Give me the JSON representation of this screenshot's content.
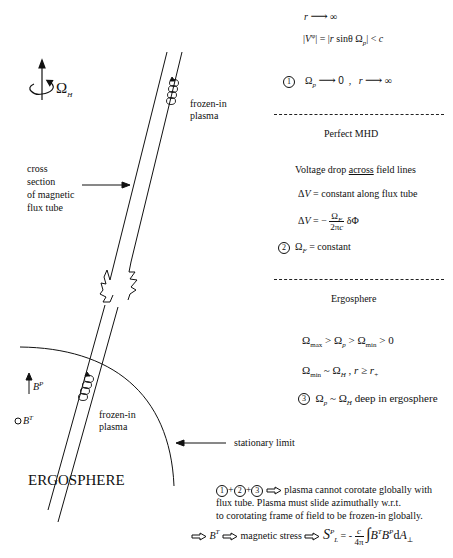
{
  "left_labels": {
    "omega_h": "Ω",
    "omega_h_sub": "H",
    "cross_section": [
      "cross",
      "section",
      "of magnetic",
      "flux tube"
    ],
    "frozen_in_top": [
      "frozen-in",
      "plasma"
    ],
    "frozen_in_bottom": [
      "frozen-in",
      "plasma"
    ],
    "b_poloidal": "B",
    "b_poloidal_sup": "P",
    "b_toroidal": "B",
    "b_toroidal_sup": "T",
    "stationary_limit": "stationary limit",
    "ergosphere_title": "ERGOSPHERE"
  },
  "right_panel": {
    "line1": {
      "r": "r",
      "arrow": "→",
      "inf": "∞"
    },
    "line2": {
      "text_left": "|V",
      "sup": "φ",
      "text_mid": "| = |",
      "r_sin": "r sinθ  Ω",
      "sub": "p",
      "text_right": "| < c"
    },
    "cond1": {
      "num": "1",
      "omega": "Ω",
      "sub": "p",
      "arrow_to": "0",
      "sep": ",",
      "r": "r",
      "inf": "∞"
    },
    "section_perfect_mhd": "Perfect MHD",
    "voltage_line": {
      "prefix": "Voltage drop ",
      "underlined": "across",
      "suffix": " field lines"
    },
    "delta_v_const": {
      "dv": "ΔV",
      "text": " = constant along flux tube"
    },
    "delta_v_formula": {
      "dv": "ΔV",
      "eq": " = −",
      "num": "Ω",
      "num_sub": "F",
      "den": "2πc",
      "tail": "δΦ"
    },
    "cond2": {
      "num": "2",
      "omega": "Ω",
      "sub": "F",
      "text": " = constant"
    },
    "section_ergosphere": "Ergosphere",
    "ineq": {
      "o1": "Ω",
      "s1": "max",
      "g1": " > ",
      "o2": "Ω",
      "s2": "p",
      "g2": " > ",
      "o3": "Ω",
      "s3": "min",
      "g3": " > 0"
    },
    "approx": {
      "o1": "Ω",
      "s1": "min",
      "tilde": " ~ ",
      "o2": "Ω",
      "s2": "H",
      "comma": " ,   ",
      "r": "r",
      "ge": " ≥ ",
      "rplus": "r",
      "rplus_sub": "+"
    },
    "cond3": {
      "num": "3",
      "o1": "Ω",
      "s1": "p",
      "tilde": " ~ ",
      "o2": "Ω",
      "s2": "H",
      "text": " deep in ergosphere"
    }
  },
  "conclusion": {
    "c1": "1",
    "c2": "2",
    "c3": "3",
    "plus": "+",
    "line1": "plasma cannot corotate globally with",
    "line2": "flux tube.  Plasma must slide azimuthally w.r.t.",
    "line3": "to corotating frame of field to be frozen-in globally.",
    "bt": "B",
    "bt_sup": "T",
    "magnetic_stress": "magnetic stress",
    "s": "S",
    "s_sup": "P",
    "s_sub": "L",
    "eq": " = - ",
    "frac_num": "c",
    "frac_den": "4π",
    "integral": "∫",
    "integrand": "B",
    "integrand_sup1": "T",
    "integrand2": "B",
    "integrand_sup2": "P",
    "d": "dA",
    "d_sub": "⊥"
  }
}
